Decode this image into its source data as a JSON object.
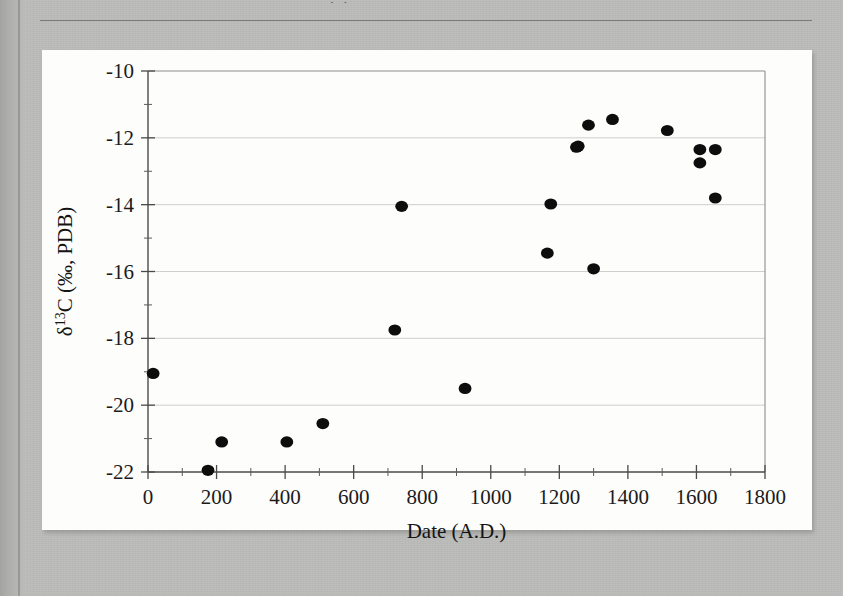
{
  "page": {
    "background_color": "#bcbcba",
    "panel_color": "#fdfdfb",
    "cropped_caption_fragment": ". ."
  },
  "chart_data": {
    "type": "scatter",
    "title": "",
    "xlabel": "Date (A.D.)",
    "ylabel": "δ13C (‰, PDB)",
    "ylabel_parts": {
      "delta": "δ",
      "superscript": "13",
      "element": "C (‰, PDB)"
    },
    "xlim": [
      0,
      1800
    ],
    "ylim": [
      -22,
      -10
    ],
    "x_ticks": [
      0,
      200,
      400,
      600,
      800,
      1000,
      1200,
      1400,
      1600,
      1800
    ],
    "x_tick_labels": [
      "0",
      "200",
      "400",
      "600",
      "800",
      "1000",
      "1200",
      "1400",
      "1600",
      "1800"
    ],
    "x_minor_interval": 100,
    "y_ticks": [
      -10,
      -12,
      -14,
      -16,
      -18,
      -20,
      -22
    ],
    "y_tick_labels": [
      "-10",
      "-12",
      "-14",
      "-16",
      "-18",
      "-20",
      "-22"
    ],
    "y_minor_interval": 1,
    "grid": "horizontal-major",
    "legend": "none",
    "marker": "filled-circle",
    "marker_color": "#0d0d0d",
    "marker_radius_px": 6,
    "point_count": 20,
    "points": [
      {
        "x": 15,
        "y": -19.05
      },
      {
        "x": 175,
        "y": -21.95
      },
      {
        "x": 215,
        "y": -21.1
      },
      {
        "x": 405,
        "y": -21.1
      },
      {
        "x": 510,
        "y": -20.55
      },
      {
        "x": 720,
        "y": -17.75
      },
      {
        "x": 740,
        "y": -14.05
      },
      {
        "x": 925,
        "y": -19.5
      },
      {
        "x": 1165,
        "y": -15.45
      },
      {
        "x": 1175,
        "y": -13.98
      },
      {
        "x": 1255,
        "y": -12.25
      },
      {
        "x": 1285,
        "y": -11.62
      },
      {
        "x": 1300,
        "y": -15.92
      },
      {
        "x": 1355,
        "y": -11.45
      },
      {
        "x": 1515,
        "y": -11.78
      },
      {
        "x": 1610,
        "y": -12.35
      },
      {
        "x": 1655,
        "y": -12.35
      },
      {
        "x": 1610,
        "y": -12.75
      },
      {
        "x": 1655,
        "y": -13.8
      },
      {
        "x": 1250,
        "y": -12.28
      }
    ]
  }
}
